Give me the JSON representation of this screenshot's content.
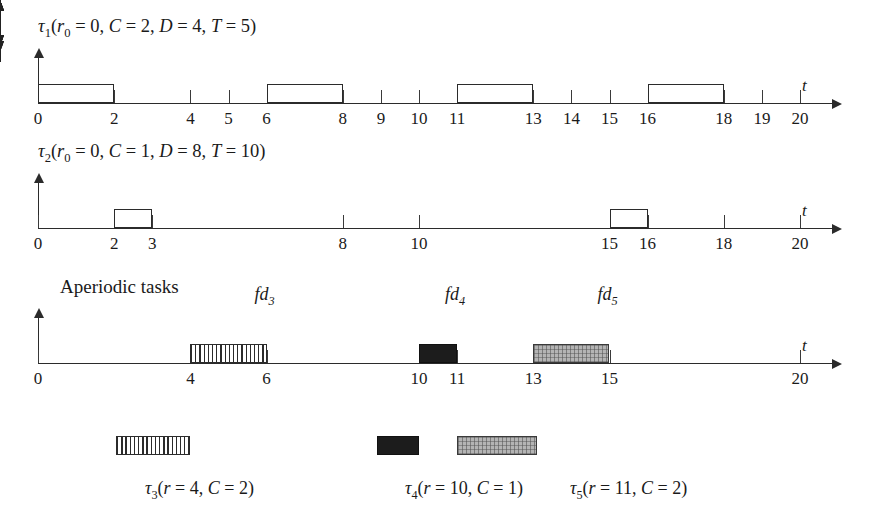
{
  "figure": {
    "type": "scheduling-timeline",
    "time_axis_label": "t",
    "x_unit_px": 38.1,
    "x_origin_px": 38,
    "time_range": [
      0,
      20
    ]
  },
  "timelines": [
    {
      "id": "tau1",
      "title": "τ1(r0 = 0, C = 2, D = 4, T = 5)",
      "title_parts": {
        "tau": "τ",
        "tau_sub": "1",
        "open": "(",
        "r": "r",
        "r_sub": "0",
        "r_eq": " = 0, ",
        "c": "C",
        "c_eq": " = 2, ",
        "d": "D",
        "d_eq": " = 4, ",
        "t": "T",
        "t_eq": " = 5)"
      },
      "baseline_y": 103,
      "axis_end_x": 832,
      "axis_label": "t",
      "releases": [
        0,
        5,
        10,
        15,
        20
      ],
      "deadlines": [
        4,
        9,
        14,
        19
      ],
      "exec_blocks": [
        {
          "start": 0,
          "end": 2,
          "fill": "white"
        },
        {
          "start": 6,
          "end": 8,
          "fill": "white"
        },
        {
          "start": 11,
          "end": 13,
          "fill": "white"
        },
        {
          "start": 16,
          "end": 18,
          "fill": "white"
        }
      ],
      "ticks": [
        0,
        2,
        4,
        5,
        6,
        8,
        9,
        10,
        11,
        13,
        14,
        15,
        16,
        18,
        19,
        20
      ],
      "tick_labels": [
        "0",
        "2",
        "4",
        "5",
        "6",
        "8",
        "9",
        "10",
        "11",
        "13",
        "14",
        "15",
        "16",
        "18",
        "19",
        "20"
      ]
    },
    {
      "id": "tau2",
      "title": "τ2(r0 = 0, C = 1, D = 8, T = 10)",
      "title_parts": {
        "tau": "τ",
        "tau_sub": "2",
        "open": "(",
        "r": "r",
        "r_sub": "0",
        "r_eq": " = 0, ",
        "c": "C",
        "c_eq": " = 1, ",
        "d": "D",
        "d_eq": " = 8, ",
        "t": "T",
        "t_eq": " = 10)"
      },
      "baseline_y": 228,
      "axis_end_x": 832,
      "axis_label": "t",
      "releases": [
        0,
        10,
        20
      ],
      "deadlines": [
        8,
        18
      ],
      "exec_blocks": [
        {
          "start": 2,
          "end": 3,
          "fill": "white"
        },
        {
          "start": 15,
          "end": 16,
          "fill": "white"
        }
      ],
      "ticks": [
        0,
        2,
        3,
        8,
        10,
        15,
        16,
        18,
        20
      ],
      "tick_labels": [
        "0",
        "2",
        "3",
        "8",
        "10",
        "15",
        "16",
        "18",
        "20"
      ]
    },
    {
      "id": "aperiodic",
      "title": "Aperiodic tasks",
      "baseline_y": 363,
      "axis_end_x": 832,
      "axis_label": "t",
      "releases": [],
      "deadlines": [],
      "exec_blocks": [
        {
          "start": 4,
          "end": 6,
          "fill": "hatch"
        },
        {
          "start": 10,
          "end": 11,
          "fill": "black"
        },
        {
          "start": 13,
          "end": 15,
          "fill": "gray"
        }
      ],
      "fd_markers": [
        {
          "time": 6,
          "label": "fd",
          "sub": "3"
        },
        {
          "time": 11,
          "label": "fd",
          "sub": "4"
        },
        {
          "time": 15,
          "label": "fd",
          "sub": "5"
        }
      ],
      "ticks": [
        0,
        4,
        6,
        10,
        11,
        13,
        15,
        20
      ],
      "tick_labels": [
        "0",
        "4",
        "6",
        "10",
        "11",
        "13",
        "15",
        "20"
      ]
    }
  ],
  "arrivals": [
    {
      "id": "tau3",
      "arrow_time": 4,
      "box": {
        "start": 2.05,
        "end": 4,
        "fill": "hatch"
      },
      "label": "τ3(r = 4, C = 2)",
      "label_parts": {
        "tau": "τ",
        "tau_sub": "3",
        "open": "(",
        "r": "r",
        "r_eq": " = 4, ",
        "c": "C",
        "c_eq": " = 2)"
      },
      "label_x": 145
    },
    {
      "id": "tau4",
      "arrow_time": 10,
      "box": {
        "start": 8.9,
        "end": 10,
        "fill": "black"
      },
      "label": "τ4(r = 10, C = 1)",
      "label_parts": {
        "tau": "τ",
        "tau_sub": "4",
        "open": "(",
        "r": "r",
        "r_eq": " = 10, ",
        "c": "C",
        "c_eq": " = 1)"
      },
      "label_x": 405
    },
    {
      "id": "tau5",
      "arrow_time": 11,
      "box": {
        "start": 11,
        "end": 13.1,
        "fill": "gray"
      },
      "label": "τ5(r = 11, C = 2)",
      "label_parts": {
        "tau": "τ",
        "tau_sub": "5",
        "open": "(",
        "r": "r",
        "r_eq": " = 11, ",
        "c": "C",
        "c_eq": " = 2)"
      },
      "label_x": 570
    }
  ]
}
